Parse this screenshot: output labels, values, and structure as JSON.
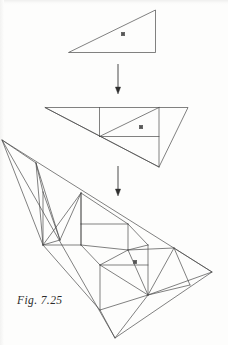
{
  "figure": {
    "caption": "Fig. 7.25",
    "kind": "geometric-diagram",
    "background_color": "#fdfdfc",
    "ink_color": "#4a4a4a",
    "marker_color": "#555555",
    "stroke_width": 0.7
  },
  "stages": [
    {
      "id": "stage-1",
      "label": "stage-1-triangle",
      "outline": [
        [
          68.5,
          52.5
        ],
        [
          155.5,
          10.0
        ],
        [
          155.5,
          52.5
        ]
      ],
      "interior_edges": [],
      "markers": [
        [
          123.0,
          34.0
        ]
      ]
    },
    {
      "id": "stage-2",
      "label": "stage-2-triangle",
      "outline": [
        [
          45.0,
          107.5
        ],
        [
          188.0,
          107.5
        ],
        [
          159.0,
          167.0
        ]
      ],
      "interior_edges": [
        [
          [
            99.5,
            107.5
          ],
          [
            99.5,
            136.5
          ]
        ],
        [
          [
            99.5,
            136.5
          ],
          [
            159.0,
            136.5
          ]
        ],
        [
          [
            99.5,
            136.5
          ],
          [
            159.0,
            107.5
          ]
        ],
        [
          [
            159.0,
            107.5
          ],
          [
            159.0,
            167.0
          ]
        ],
        [
          [
            45.0,
            107.5
          ],
          [
            159.0,
            167.0
          ]
        ]
      ],
      "markers": [
        [
          141.0,
          127.0
        ]
      ]
    },
    {
      "id": "stage-3",
      "label": "stage-3-triangle",
      "outline": [
        [
          2.0,
          140.0
        ],
        [
          212.0,
          272.0
        ],
        [
          115.0,
          338.0
        ]
      ],
      "markers": [
        [
          135.0,
          262.0
        ]
      ],
      "interior_edges": [
        [
          [
            2.0,
            140.0
          ],
          [
            36.0,
            163.0
          ]
        ],
        [
          [
            36.0,
            163.0
          ],
          [
            43.0,
            245.0
          ]
        ],
        [
          [
            36.0,
            163.0
          ],
          [
            43.0,
            192.0
          ]
        ],
        [
          [
            43.0,
            192.0
          ],
          [
            43.0,
            245.0
          ]
        ],
        [
          [
            36.0,
            163.0
          ],
          [
            60.0,
            240.0
          ]
        ],
        [
          [
            43.0,
            192.0
          ],
          [
            60.0,
            240.0
          ]
        ],
        [
          [
            43.0,
            245.0
          ],
          [
            60.0,
            240.0
          ]
        ],
        [
          [
            2.0,
            140.0
          ],
          [
            43.0,
            245.0
          ]
        ],
        [
          [
            43.0,
            245.0
          ],
          [
            81.0,
            193.0
          ]
        ],
        [
          [
            60.0,
            240.0
          ],
          [
            81.0,
            193.0
          ]
        ],
        [
          [
            81.0,
            193.0
          ],
          [
            81.0,
            245.0
          ]
        ],
        [
          [
            43.0,
            245.0
          ],
          [
            81.0,
            245.0
          ]
        ],
        [
          [
            81.0,
            193.0
          ],
          [
            128.0,
            224.0
          ]
        ],
        [
          [
            81.0,
            224.0
          ],
          [
            128.0,
            224.0
          ]
        ],
        [
          [
            81.0,
            193.0
          ],
          [
            81.0,
            224.0
          ]
        ],
        [
          [
            128.0,
            224.0
          ],
          [
            128.0,
            250.0
          ]
        ],
        [
          [
            81.0,
            245.0
          ],
          [
            128.0,
            250.0
          ]
        ],
        [
          [
            81.0,
            245.0
          ],
          [
            100.0,
            265.0
          ]
        ],
        [
          [
            100.0,
            265.0
          ],
          [
            128.0,
            250.0
          ]
        ],
        [
          [
            100.0,
            265.0
          ],
          [
            148.0,
            295.0
          ]
        ],
        [
          [
            128.0,
            250.0
          ],
          [
            148.0,
            295.0
          ]
        ],
        [
          [
            128.0,
            250.0
          ],
          [
            174.0,
            248.0
          ]
        ],
        [
          [
            148.0,
            245.0
          ],
          [
            148.0,
            295.0
          ]
        ],
        [
          [
            100.0,
            265.0
          ],
          [
            148.0,
            265.0
          ]
        ],
        [
          [
            100.0,
            265.0
          ],
          [
            100.0,
            310.0
          ]
        ],
        [
          [
            100.0,
            310.0
          ],
          [
            148.0,
            295.0
          ]
        ],
        [
          [
            43.0,
            245.0
          ],
          [
            100.0,
            310.0
          ]
        ],
        [
          [
            100.0,
            310.0
          ],
          [
            115.0,
            338.0
          ]
        ],
        [
          [
            148.0,
            295.0
          ],
          [
            115.0,
            338.0
          ]
        ],
        [
          [
            148.0,
            295.0
          ],
          [
            174.0,
            248.0
          ]
        ],
        [
          [
            174.0,
            248.0
          ],
          [
            212.0,
            272.0
          ]
        ],
        [
          [
            148.0,
            295.0
          ],
          [
            212.0,
            272.0
          ]
        ],
        [
          [
            174.0,
            248.0
          ],
          [
            190.0,
            285.0
          ]
        ],
        [
          [
            148.0,
            295.0
          ],
          [
            190.0,
            285.0
          ]
        ],
        [
          [
            81.0,
            245.0
          ],
          [
            81.0,
            224.0
          ]
        ],
        [
          [
            128.0,
            224.0
          ],
          [
            148.0,
            245.0
          ]
        ],
        [
          [
            128.0,
            250.0
          ],
          [
            148.0,
            245.0
          ]
        ]
      ]
    }
  ],
  "arrows": [
    {
      "id": "arrow-1",
      "label": "arrow-stage1-to-stage2",
      "x": 118.0,
      "y_start": 64.0,
      "y_end": 94.0
    },
    {
      "id": "arrow-2",
      "label": "arrow-stage2-to-stage3",
      "x": 118.0,
      "y_start": 166.0,
      "y_end": 196.0
    }
  ]
}
